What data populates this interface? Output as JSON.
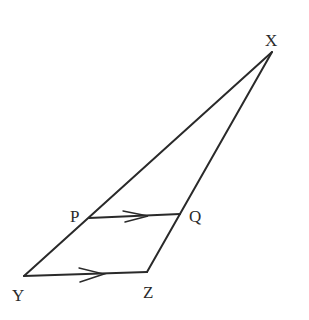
{
  "diagram": {
    "type": "triangle-with-parallel-segment",
    "stroke_color": "#2a2a2a",
    "points": {
      "X": {
        "label": "X",
        "x": 272,
        "y": 52,
        "lx": 267,
        "ly": 45
      },
      "Y": {
        "label": "Y",
        "x": 24,
        "y": 276,
        "lx": 12,
        "ly": 300
      },
      "Z": {
        "label": "Z",
        "x": 147,
        "y": 272,
        "lx": 143,
        "ly": 297
      },
      "P": {
        "label": "P",
        "x": 89,
        "y": 218,
        "lx": 70,
        "ly": 222
      },
      "Q": {
        "label": "Q",
        "x": 180,
        "y": 214,
        "lx": 189,
        "ly": 222
      }
    },
    "segments": [
      {
        "from": "X",
        "to": "Y"
      },
      {
        "from": "X",
        "to": "Z"
      },
      {
        "from": "Y",
        "to": "Z",
        "arrow": true
      },
      {
        "from": "P",
        "to": "Q",
        "arrow": true
      }
    ]
  }
}
